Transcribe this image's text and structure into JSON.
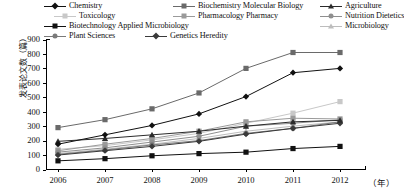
{
  "chart_data": {
    "type": "line",
    "title": "",
    "xlabel": "（年）",
    "ylabel": "发表论文数（篇）",
    "x": [
      2006,
      2007,
      2008,
      2009,
      2010,
      2011,
      2012
    ],
    "categories": [
      "2006",
      "2007",
      "2008",
      "2009",
      "2010",
      "2011",
      "2012"
    ],
    "ylim": [
      0,
      900
    ],
    "yticks": [
      0,
      100,
      200,
      300,
      400,
      500,
      600,
      700,
      800,
      900
    ],
    "grid": false,
    "legend_position": "top",
    "series": [
      {
        "name": "Chemistry",
        "marker": "diamond",
        "color": "#111111",
        "values": [
          175,
          240,
          305,
          385,
          505,
          670,
          700
        ]
      },
      {
        "name": "Biochemistry Molecular Biology",
        "marker": "square",
        "color": "#6a6a6a",
        "values": [
          290,
          345,
          420,
          530,
          700,
          810,
          810
        ]
      },
      {
        "name": "Agriculture",
        "marker": "triangle",
        "color": "#2b2b2b",
        "values": [
          195,
          215,
          240,
          265,
          300,
          330,
          340
        ]
      },
      {
        "name": "Toxicology",
        "marker": "square",
        "color": "#c8c8c8",
        "values": [
          140,
          165,
          205,
          250,
          320,
          390,
          470
        ]
      },
      {
        "name": "Pharmacology Pharmacy",
        "marker": "square",
        "color": "#9a9a9a",
        "values": [
          130,
          175,
          215,
          265,
          330,
          355,
          350
        ]
      },
      {
        "name": "Nutrition Dietetics",
        "marker": "circle",
        "color": "#8f8f8f",
        "values": [
          120,
          150,
          190,
          230,
          300,
          320,
          345
        ]
      },
      {
        "name": "Biotechnology Applied Microbiology",
        "marker": "square",
        "color": "#111111",
        "values": [
          60,
          75,
          95,
          110,
          120,
          145,
          160
        ]
      },
      {
        "name": "Microbiology",
        "marker": "triangle",
        "color": "#bdbdbd",
        "values": [
          110,
          140,
          175,
          215,
          265,
          300,
          330
        ]
      },
      {
        "name": "Plant Sciences",
        "marker": "circle",
        "color": "#7a7a7a",
        "values": [
          105,
          135,
          170,
          200,
          250,
          285,
          330
        ]
      },
      {
        "name": "Genetics Heredity",
        "marker": "diamond",
        "color": "#3a3a3a",
        "values": [
          100,
          130,
          160,
          195,
          245,
          285,
          320
        ]
      }
    ]
  },
  "legend": {
    "items": [
      {
        "label": "Chemistry",
        "marker": "diamond",
        "color": "#111111"
      },
      {
        "label": "Biochemistry Molecular Biology",
        "marker": "square",
        "color": "#6a6a6a"
      },
      {
        "label": "Agriculture",
        "marker": "triangle",
        "color": "#2b2b2b"
      },
      {
        "label": "Toxicology",
        "marker": "square",
        "color": "#c8c8c8"
      },
      {
        "label": "Pharmacology Pharmacy",
        "marker": "square",
        "color": "#9a9a9a"
      },
      {
        "label": "Nutrition Dietetics",
        "marker": "circle",
        "color": "#8f8f8f"
      },
      {
        "label": "Biotechnology Applied Microbiology",
        "marker": "square",
        "color": "#111111"
      },
      {
        "label": "Microbiology",
        "marker": "triangle",
        "color": "#bdbdbd"
      },
      {
        "label": "Plant Sciences",
        "marker": "circle",
        "color": "#7a7a7a"
      },
      {
        "label": "Genetics Heredity",
        "marker": "diamond",
        "color": "#3a3a3a"
      }
    ]
  }
}
